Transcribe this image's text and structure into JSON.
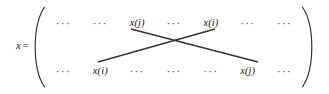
{
  "figure": {
    "type": "matrix-crossover-diagram",
    "lhs": {
      "variable": "x",
      "equals": "="
    },
    "delimiters": {
      "left": "(",
      "right": ")"
    },
    "ellipsis_glyph": "···",
    "matrix": {
      "rows": [
        {
          "name": "top-row",
          "cells": [
            {
              "kind": "ellipsis",
              "text": "···"
            },
            {
              "kind": "ellipsis",
              "text": "···"
            },
            {
              "kind": "term",
              "text": "x(j)"
            },
            {
              "kind": "ellipsis",
              "text": "···"
            },
            {
              "kind": "term",
              "text": "x(i)"
            },
            {
              "kind": "ellipsis",
              "text": "···"
            },
            {
              "kind": "ellipsis",
              "text": "···"
            }
          ]
        },
        {
          "name": "bottom-row",
          "cells": [
            {
              "kind": "ellipsis",
              "text": "···"
            },
            {
              "kind": "term",
              "text": "x(i)"
            },
            {
              "kind": "ellipsis",
              "text": "···"
            },
            {
              "kind": "ellipsis",
              "text": "···"
            },
            {
              "kind": "ellipsis",
              "text": "···"
            },
            {
              "kind": "term",
              "text": "x(j)"
            },
            {
              "kind": "ellipsis",
              "text": "···"
            }
          ]
        }
      ]
    },
    "connectors": [
      {
        "name": "swap-line-j-descending",
        "from": {
          "x": 131,
          "y": 29
        },
        "to": {
          "x": 258,
          "y": 62
        }
      },
      {
        "name": "swap-line-i-ascending",
        "from": {
          "x": 98,
          "y": 62
        },
        "to": {
          "x": 215,
          "y": 29
        }
      }
    ],
    "colors": {
      "background": "#ffffff",
      "text": "#1a1a1a",
      "line": "#333333",
      "delimiter": "#2b2b2b"
    }
  }
}
